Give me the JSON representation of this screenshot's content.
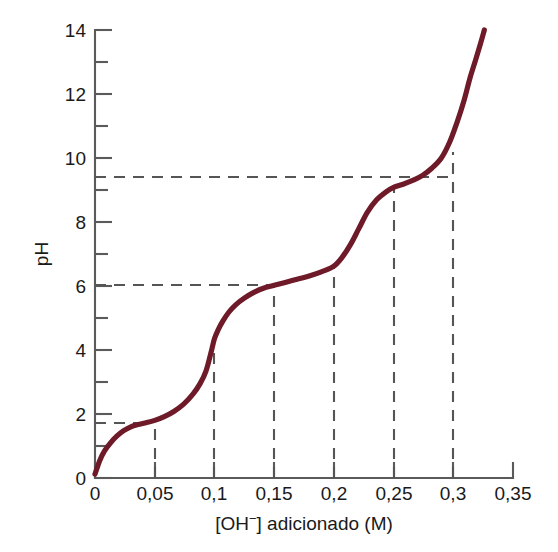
{
  "chart_data": {
    "type": "line",
    "title": "",
    "xlabel": "[OH⁻] adicionado (M)",
    "ylabel": "pH",
    "xlim": [
      0,
      0.35
    ],
    "ylim": [
      0,
      14
    ],
    "grid": false,
    "legend_position": "none",
    "decimal_separator": ",",
    "series": [
      {
        "name": "Curva de titulação",
        "color": "#6e1a28",
        "x": [
          0.0,
          0.004,
          0.008,
          0.013,
          0.018,
          0.024,
          0.03,
          0.036,
          0.042,
          0.05,
          0.058,
          0.066,
          0.074,
          0.082,
          0.088,
          0.093,
          0.097,
          0.1,
          0.103,
          0.107,
          0.112,
          0.118,
          0.125,
          0.133,
          0.141,
          0.15,
          0.16,
          0.17,
          0.18,
          0.19,
          0.2,
          0.207,
          0.214,
          0.221,
          0.228,
          0.236,
          0.244,
          0.25,
          0.258,
          0.266,
          0.274,
          0.282,
          0.29,
          0.297,
          0.303,
          0.309,
          0.314,
          0.319,
          0.323,
          0.326
        ],
        "y": [
          0.12,
          0.55,
          0.85,
          1.1,
          1.3,
          1.48,
          1.6,
          1.67,
          1.72,
          1.8,
          1.92,
          2.08,
          2.3,
          2.62,
          2.95,
          3.35,
          3.9,
          4.35,
          4.62,
          4.9,
          5.18,
          5.42,
          5.62,
          5.8,
          5.93,
          6.02,
          6.12,
          6.22,
          6.32,
          6.45,
          6.62,
          6.9,
          7.3,
          7.8,
          8.3,
          8.7,
          8.95,
          9.08,
          9.18,
          9.3,
          9.45,
          9.68,
          10.0,
          10.5,
          11.1,
          11.8,
          12.5,
          13.1,
          13.6,
          14.0
        ]
      }
    ],
    "x_major_ticks": [
      0,
      0.05,
      0.1,
      0.15,
      0.2,
      0.25,
      0.3,
      0.35
    ],
    "x_tick_labels": [
      "0",
      "0,05",
      "0,1",
      "0,15",
      "0,2",
      "0,25",
      "0,3",
      "0,35"
    ],
    "y_major_ticks": [
      0,
      2,
      4,
      6,
      8,
      10,
      12,
      14
    ],
    "y_tick_labels": [
      "0",
      "2",
      "4",
      "6",
      "8",
      "10",
      "12",
      "14"
    ],
    "y_minor_ticks": [
      1,
      3,
      5,
      7,
      9,
      11,
      13
    ],
    "annotations": [
      {
        "name": "half-equivalence-1",
        "type": "horizontal-guide",
        "y": 1.72,
        "x_from": 0.0,
        "x_to": 0.04,
        "label": "pH 1,7"
      },
      {
        "name": "equivalence-guide-0.05",
        "type": "vertical-guide",
        "x": 0.05,
        "y_from": 0.0,
        "y_to": 1.8
      },
      {
        "name": "equivalence-guide-0.1",
        "type": "vertical-guide",
        "x": 0.1,
        "y_from": 0.0,
        "y_to": 4.35
      },
      {
        "name": "half-equivalence-2",
        "type": "horizontal-guide",
        "y": 6.02,
        "x_from": 0.0,
        "x_to": 0.15,
        "label": "pH 6,0"
      },
      {
        "name": "equivalence-guide-0.15",
        "type": "vertical-guide",
        "x": 0.15,
        "y_from": 0.0,
        "y_to": 6.02
      },
      {
        "name": "equivalence-guide-0.2",
        "type": "vertical-guide",
        "x": 0.2,
        "y_from": 0.0,
        "y_to": 6.62
      },
      {
        "name": "equivalence-guide-0.25",
        "type": "vertical-guide",
        "x": 0.25,
        "y_from": 0.0,
        "y_to": 9.08
      },
      {
        "name": "half-equivalence-3",
        "type": "horizontal-guide",
        "y": 9.4,
        "x_from": 0.0,
        "x_to": 0.3,
        "label": "pH 9,4"
      },
      {
        "name": "equivalence-guide-0.3",
        "type": "vertical-guide",
        "x": 0.3,
        "y_from": 0.0,
        "y_to": 10.2
      }
    ]
  },
  "colors": {
    "curve": "#6e1a28",
    "axis": "#5a5a5a",
    "guide": "#555555",
    "text": "#1a1a1a",
    "background": "#ffffff"
  },
  "xaxis_title_parts": {
    "bracket_open": "[OH",
    "superscript": "−",
    "bracket_close": "] adicionado (M)"
  }
}
